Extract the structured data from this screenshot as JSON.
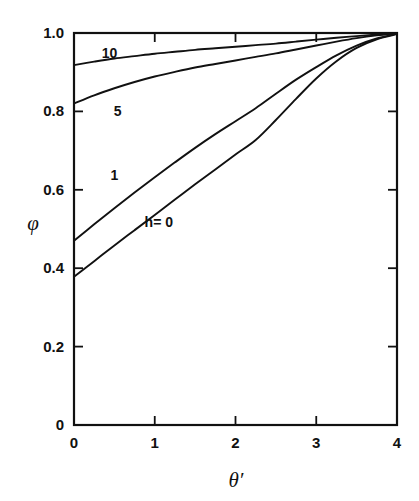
{
  "chart_data": {
    "type": "line",
    "title": "",
    "xlabel": "θ′",
    "ylabel": "φ",
    "xlim": [
      0,
      4
    ],
    "ylim": [
      0,
      1
    ],
    "grid": false,
    "legend_position": "inline-curve-labels",
    "xticks": [
      0,
      1,
      2,
      3,
      4
    ],
    "xtick_labels": [
      "0",
      "1",
      "2",
      "3",
      "4"
    ],
    "yticks": [
      0,
      0.2,
      0.4,
      0.6,
      0.8,
      1.0
    ],
    "ytick_labels": [
      "0",
      "0.2",
      "0.4",
      "0.6",
      "0.8",
      "1.0"
    ],
    "x": [
      0,
      0.25,
      0.5,
      0.75,
      1.0,
      1.25,
      1.5,
      1.75,
      2.0,
      2.25,
      2.5,
      2.75,
      3.0,
      3.25,
      3.5,
      3.75,
      4.0
    ],
    "series": [
      {
        "name": "h=0",
        "label": "h= 0",
        "label_x": 1.05,
        "label_y": 0.505,
        "values": [
          0.378,
          0.418,
          0.458,
          0.497,
          0.536,
          0.575,
          0.614,
          0.652,
          0.69,
          0.727,
          0.778,
          0.832,
          0.884,
          0.928,
          0.962,
          0.984,
          0.997
        ]
      },
      {
        "name": "h=1",
        "label": "1",
        "label_x": 0.5,
        "label_y": 0.625,
        "values": [
          0.47,
          0.512,
          0.553,
          0.593,
          0.632,
          0.67,
          0.707,
          0.742,
          0.775,
          0.808,
          0.845,
          0.881,
          0.913,
          0.943,
          0.968,
          0.986,
          0.998
        ]
      },
      {
        "name": "h=5",
        "label": "5",
        "label_x": 0.54,
        "label_y": 0.787,
        "values": [
          0.82,
          0.841,
          0.859,
          0.875,
          0.889,
          0.901,
          0.912,
          0.921,
          0.93,
          0.939,
          0.948,
          0.958,
          0.968,
          0.978,
          0.987,
          0.994,
          0.999
        ]
      },
      {
        "name": "h=10",
        "label": "10",
        "label_x": 0.44,
        "label_y": 0.935,
        "values": [
          0.918,
          0.927,
          0.935,
          0.941,
          0.947,
          0.952,
          0.957,
          0.961,
          0.965,
          0.969,
          0.973,
          0.978,
          0.983,
          0.988,
          0.992,
          0.996,
          0.999
        ]
      }
    ]
  },
  "figure": {
    "background_color": "#ffffff",
    "line_color": "#111111",
    "axis_title_x": "θ′",
    "axis_title_y": "φ"
  }
}
